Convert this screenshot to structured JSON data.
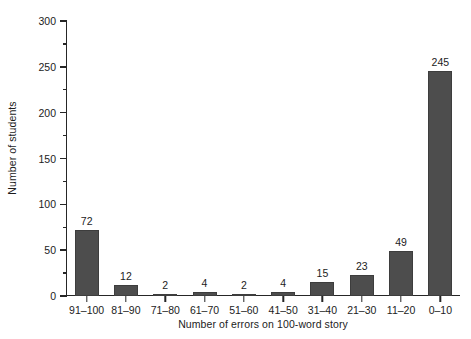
{
  "chart_data": {
    "type": "bar",
    "title": "",
    "xlabel": "Number of errors on 100-word story",
    "ylabel": "Number of students",
    "categories": [
      "91–100",
      "81–90",
      "71–80",
      "61–70",
      "51–60",
      "41–50",
      "31–40",
      "21–30",
      "11–20",
      "0–10"
    ],
    "values": [
      72,
      12,
      2,
      4,
      2,
      4,
      15,
      23,
      49,
      245
    ],
    "value_labels": [
      "72",
      "12",
      "2",
      "4",
      "2",
      "4",
      "15",
      "23",
      "49",
      "245"
    ],
    "ylim": [
      0,
      300
    ],
    "y_ticks": [
      0,
      50,
      100,
      150,
      200,
      250,
      300
    ],
    "y_tick_labels": [
      "0",
      "50",
      "100",
      "150",
      "200",
      "250",
      "300"
    ],
    "y_minor_ticks": [
      25,
      75,
      125,
      175,
      225,
      275
    ],
    "grid": false,
    "legend": false,
    "legend_position": "none",
    "bar_color": "#4d4d4d",
    "axis_color": "#262626",
    "text_color": "#1c1c1c",
    "background_color": "#ffffff"
  }
}
